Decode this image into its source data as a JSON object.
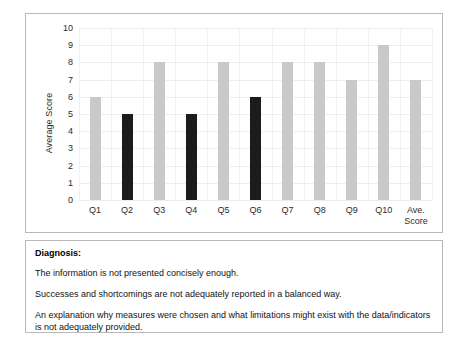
{
  "chart_data": {
    "type": "bar",
    "title": "",
    "xlabel": "",
    "ylabel": "Average Score",
    "ylim": [
      0,
      10
    ],
    "ytick_values": [
      0,
      1,
      2,
      3,
      4,
      5,
      6,
      7,
      8,
      9,
      10
    ],
    "grid": true,
    "legend": "none",
    "categories": [
      "Q1",
      "Q2",
      "Q3",
      "Q4",
      "Q5",
      "Q6",
      "Q7",
      "Q8",
      "Q9",
      "Q10",
      "Ave.\nScore"
    ],
    "values": [
      6,
      5,
      8,
      5,
      8,
      6,
      8,
      8,
      7,
      9,
      7
    ],
    "bar_colors": [
      "#c9c9c9",
      "#1c1c1c",
      "#c9c9c9",
      "#1c1c1c",
      "#c9c9c9",
      "#1c1c1c",
      "#c9c9c9",
      "#c9c9c9",
      "#c9c9c9",
      "#c9c9c9",
      "#c9c9c9"
    ],
    "colors": {
      "bar_light": "#c9c9c9",
      "bar_dark": "#1c1c1c",
      "gridline": "#ededed",
      "border": "#b8b8b8",
      "text": "#2b2b2b"
    }
  },
  "diagnosis": {
    "heading": "Diagnosis:",
    "lines": [
      "The information is not presented concisely enough.",
      "Successes and shortcomings are not adequately reported in a balanced way.",
      "An explanation why measures were chosen and what limitations might exist with the data/indicators is not adequately provided."
    ]
  }
}
